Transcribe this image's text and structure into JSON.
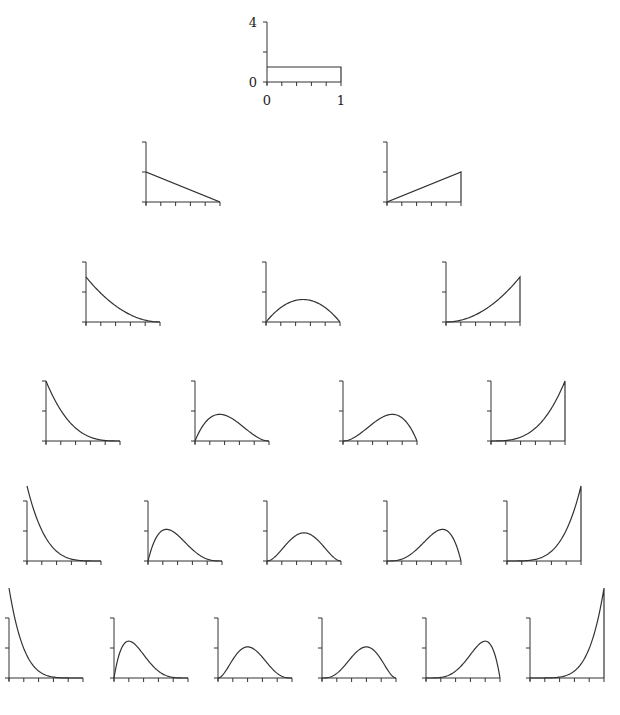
{
  "chart_data": {
    "type": "line",
    "title": "",
    "xlabel": "",
    "ylabel": "",
    "xlim": [
      0,
      1
    ],
    "ylim": [
      0,
      4
    ],
    "x_ticks": [
      0,
      0.2,
      0.4,
      0.6,
      0.8,
      1.0
    ],
    "y_ticks": [
      0,
      2,
      4
    ],
    "tick_labels": {
      "x": [
        "0",
        "1"
      ],
      "y": [
        "0",
        "4"
      ]
    },
    "grid": false,
    "legend": null,
    "rows": [
      {
        "degree": 0,
        "panels": [
          {
            "k": 0,
            "formula": "1",
            "peak": 1
          }
        ]
      },
      {
        "degree": 1,
        "panels": [
          {
            "k": 0,
            "formula": "2(1-x)",
            "peak": 2
          },
          {
            "k": 1,
            "formula": "2x",
            "peak": 2
          }
        ]
      },
      {
        "degree": 2,
        "panels": [
          {
            "k": 0,
            "formula": "3(1-x)^2",
            "peak": 3
          },
          {
            "k": 1,
            "formula": "6x(1-x)",
            "peak": 1.5
          },
          {
            "k": 2,
            "formula": "3x^2",
            "peak": 3
          }
        ]
      },
      {
        "degree": 3,
        "panels": [
          {
            "k": 0,
            "formula": "4(1-x)^3",
            "peak": 4
          },
          {
            "k": 1,
            "formula": "12x(1-x)^2",
            "peak": 1.78
          },
          {
            "k": 2,
            "formula": "12x^2(1-x)",
            "peak": 1.78
          },
          {
            "k": 3,
            "formula": "4x^3",
            "peak": 4
          }
        ]
      },
      {
        "degree": 4,
        "panels": [
          {
            "k": 0,
            "formula": "5(1-x)^4",
            "peak": 5
          },
          {
            "k": 1,
            "formula": "20x(1-x)^3",
            "peak": 2.11
          },
          {
            "k": 2,
            "formula": "30x^2(1-x)^2",
            "peak": 1.875
          },
          {
            "k": 3,
            "formula": "20x^3(1-x)",
            "peak": 2.11
          },
          {
            "k": 4,
            "formula": "5x^4",
            "peak": 5
          }
        ]
      },
      {
        "degree": 5,
        "panels": [
          {
            "k": 0,
            "formula": "6(1-x)^5",
            "peak": 6
          },
          {
            "k": 1,
            "formula": "30x(1-x)^4",
            "peak": 2.46
          },
          {
            "k": 2,
            "formula": "60x^2(1-x)^3",
            "peak": 2.07
          },
          {
            "k": 3,
            "formula": "60x^3(1-x)^2",
            "peak": 2.07
          },
          {
            "k": 4,
            "formula": "30x^4(1-x)",
            "peak": 2.46
          },
          {
            "k": 5,
            "formula": "6x^5",
            "peak": 6
          }
        ]
      }
    ]
  },
  "layout": {
    "axis_width": 74,
    "axis_height": 60,
    "rows": [
      {
        "baseline": 82,
        "origins": [
          267
        ]
      },
      {
        "baseline": 202,
        "origins": [
          146,
          387
        ]
      },
      {
        "baseline": 322,
        "origins": [
          86,
          266,
          446
        ]
      },
      {
        "baseline": 441,
        "origins": [
          46,
          195,
          343,
          491
        ]
      },
      {
        "baseline": 561,
        "origins": [
          27,
          148,
          267,
          387,
          507
        ]
      },
      {
        "baseline": 678,
        "origins": [
          9,
          114,
          218,
          322,
          426,
          530
        ]
      }
    ]
  }
}
